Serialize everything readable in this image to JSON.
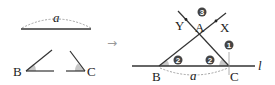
{
  "left_figure": {
    "segment_label": "a",
    "angle_B_label": "B",
    "angle_C_label": "C"
  },
  "arrow": {
    "symbol": "→"
  },
  "right_figure": {
    "vertex_A": "A",
    "vertex_B": "B",
    "vertex_C": "C",
    "point_X": "X",
    "point_Y": "Y",
    "line_label": "l",
    "base_label": "a",
    "steps": {
      "step1": "1",
      "step2_B": "2",
      "step2_C": "2",
      "step3": "3"
    }
  },
  "colors": {
    "line": "#333333",
    "angle_fill": "#c8c8c8",
    "dashed_arc": "#999999",
    "step_badge": "#444444",
    "arrow": "#999999"
  }
}
